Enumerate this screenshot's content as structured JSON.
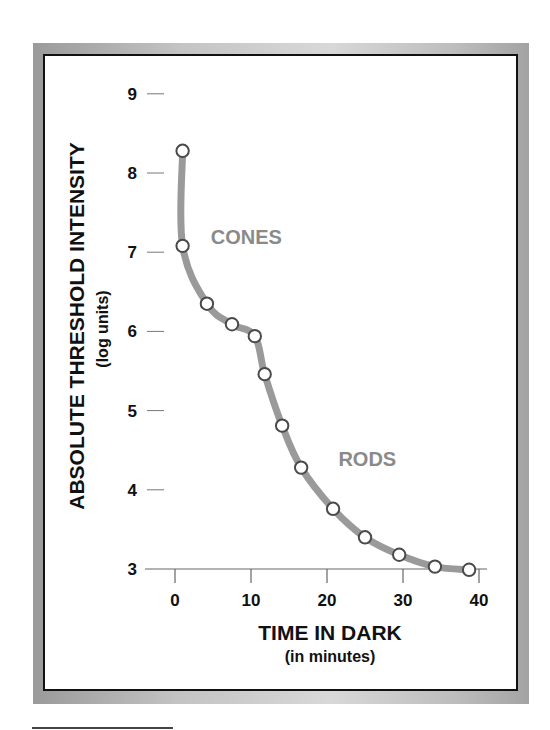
{
  "chart_data": {
    "type": "line",
    "title": "",
    "xlabel": "TIME IN DARK",
    "xlabel_sub": "(in minutes)",
    "ylabel": "ABSOLUTE THRESHOLD INTENSITY",
    "ylabel_sub": "(log units)",
    "xlim": [
      0,
      40
    ],
    "ylim": [
      3,
      9
    ],
    "x_ticks": [
      0,
      10,
      20,
      30,
      40
    ],
    "y_ticks": [
      3,
      4,
      5,
      6,
      7,
      8,
      9
    ],
    "grid": false,
    "legend": null,
    "series": [
      {
        "name": "Dark adaptation curve",
        "x": [
          1,
          1,
          4.2,
          7.5,
          10.5,
          11.8,
          14.1,
          16.6,
          20.8,
          25.0,
          29.5,
          34.2,
          38.7
        ],
        "y": [
          8.28,
          7.08,
          6.35,
          6.09,
          5.94,
          5.46,
          4.81,
          4.28,
          3.76,
          3.4,
          3.18,
          3.03,
          2.99
        ]
      }
    ],
    "annotations": [
      {
        "text": "CONES",
        "x": 4.7,
        "y": 7.1
      },
      {
        "text": "RODS",
        "x": 21.5,
        "y": 4.3
      }
    ]
  },
  "colors": {
    "line": "#9a9a9a",
    "marker_stroke": "#4a4a4a",
    "marker_fill": "#ffffff",
    "annotation": "#8a8a8a",
    "text": "#111111"
  }
}
